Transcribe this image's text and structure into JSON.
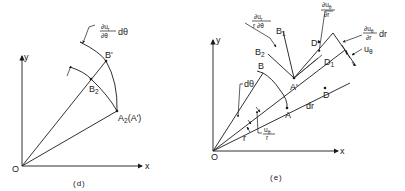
{
  "panels": [
    {
      "caption": "(d)",
      "axes": {
        "x_label": "x",
        "y_label": "y",
        "origin_label": "O"
      },
      "points": {
        "B_prime": "B'",
        "B2": "B",
        "B2_sub": "2",
        "A2": "A",
        "A2_sub": "2",
        "A2_paren": "(A')"
      },
      "annotation": {
        "num": "∂u",
        "num_sub": "r",
        "den": "∂θ",
        "suffix": "dθ"
      }
    },
    {
      "caption": "(e)",
      "axes": {
        "x_label": "x",
        "y_label": "y",
        "origin_label": "O"
      },
      "points": {
        "A": "A",
        "B": "B",
        "D": "D",
        "A_prime": "A'",
        "B1": "B",
        "B1_sub": "1",
        "B2": "B",
        "B2_sub": "2",
        "D1": "D",
        "D1_sub": "1",
        "D_prime": "D'"
      },
      "labels": {
        "dtheta": "dθ",
        "dr": "dr",
        "r": "r",
        "ue_over_r_num": "u",
        "ue_over_r_sub": "θ",
        "ue_over_r_den": "r",
        "dur_num": "∂u",
        "dur_sub": "r",
        "dur_den": "r ∂θ",
        "duth_num": "∂u",
        "duth_sub": "θ",
        "duth_den": "∂r",
        "duth_dr_num": "∂u",
        "duth_dr_sub": "θ",
        "duth_dr_den": "∂r",
        "duth_dr_suffix": "dr",
        "u_theta": "u",
        "u_theta_sub": "θ"
      }
    }
  ]
}
